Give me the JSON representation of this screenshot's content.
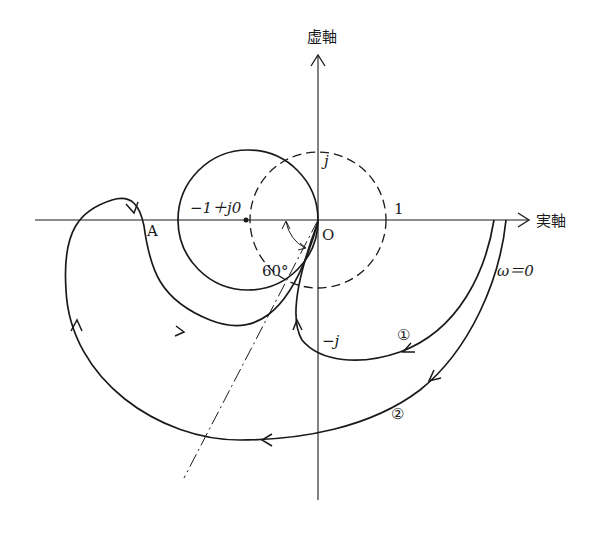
{
  "diagram": {
    "type": "nyquist-plot",
    "axes": {
      "imag_label": "虚軸",
      "real_label": "実軸"
    },
    "labels": {
      "origin": "O",
      "critical_point": "−1＋j0",
      "plus_j": "j",
      "minus_j": "−j",
      "one": "1",
      "point_a": "A",
      "angle": "60°",
      "omega_zero": "ω＝0",
      "curve1": "①",
      "curve2": "②"
    },
    "elements": {
      "unit_circle": "dashed circle, radius 1 centered at origin",
      "m_circle": "solid circle through origin centered near −1",
      "phase_line": "dash-dot line at 60° below negative real axis through origin",
      "curve1": "Nyquist locus ① starting at ω=0 on positive real axis, spiraling into origin",
      "curve2": "Nyquist locus ② starting at ω=0, looping around left through point A into origin"
    },
    "colors": {
      "ink": "#1a1a1a",
      "background": "#ffffff"
    }
  }
}
